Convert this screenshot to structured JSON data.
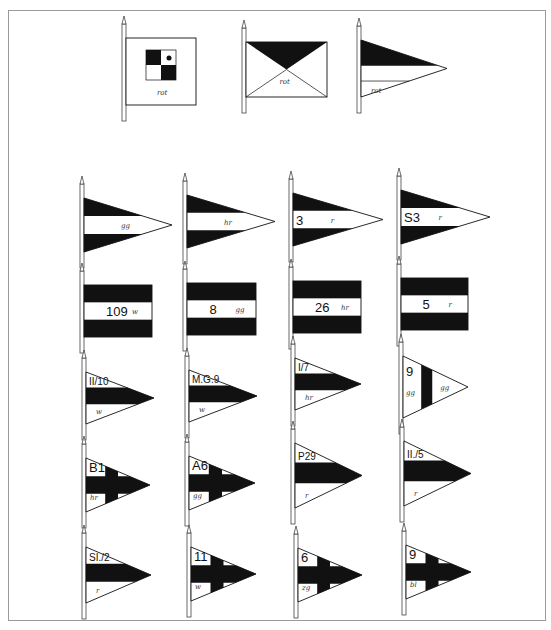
{
  "plate": {
    "frame": {
      "x": 8,
      "y": 10,
      "w": 538,
      "h": 611
    },
    "colors": {
      "ink": "#111111",
      "paper": "#ffffff",
      "frame": "#9a9a9a",
      "pole": "#555555"
    }
  },
  "top_row": [
    {
      "id": "checker-flag",
      "type": "checker",
      "pole_x": 125,
      "top": 38,
      "bottom": 105,
      "right": 196,
      "color_label": "rot",
      "corner_mark": "I.V."
    },
    {
      "id": "saltire-flag",
      "type": "saltire",
      "pole_x": 245,
      "top": 42,
      "bottom": 97,
      "right": 327,
      "color_label": "rot"
    },
    {
      "id": "split-pennant",
      "type": "split-pennant",
      "pole_x": 360,
      "top": 40,
      "bottom": 97,
      "tip_x": 447,
      "color_label": "rot"
    }
  ],
  "rows": [
    {
      "name": "triband-pennants",
      "items": [
        {
          "type": "tri-pennant",
          "pole_x": 83,
          "top": 198,
          "bottom": 252,
          "tip_x": 172,
          "number": "",
          "color_label": "gg"
        },
        {
          "type": "tri-pennant",
          "pole_x": 186,
          "top": 195,
          "bottom": 248,
          "tip_x": 275,
          "number": "",
          "color_label": "hr"
        },
        {
          "type": "tri-pennant",
          "pole_x": 292,
          "top": 193,
          "bottom": 246,
          "tip_x": 383,
          "number": "3",
          "color_label": "r"
        },
        {
          "type": "tri-pennant",
          "pole_x": 400,
          "top": 190,
          "bottom": 244,
          "tip_x": 490,
          "number": "S3",
          "color_label": "r"
        }
      ]
    },
    {
      "name": "triband-flags",
      "items": [
        {
          "type": "tri-flag",
          "pole_x": 83,
          "top": 285,
          "bottom": 337,
          "right": 152,
          "number": "109",
          "color_label": "w"
        },
        {
          "type": "tri-flag",
          "pole_x": 186,
          "top": 283,
          "bottom": 335,
          "right": 256,
          "number": "8",
          "color_label": "gg"
        },
        {
          "type": "tri-flag",
          "pole_x": 292,
          "top": 281,
          "bottom": 333,
          "right": 361,
          "number": "26",
          "color_label": "hr"
        },
        {
          "type": "tri-flag",
          "pole_x": 400,
          "top": 278,
          "bottom": 330,
          "right": 468,
          "number": "5",
          "color_label": "r"
        }
      ]
    },
    {
      "name": "band-pennants",
      "items": [
        {
          "type": "band-pennant",
          "pole_x": 85,
          "top": 372,
          "bottom": 424,
          "tip_x": 154,
          "number": "II/10",
          "color_label": "w"
        },
        {
          "type": "band-pennant",
          "pole_x": 188,
          "top": 370,
          "bottom": 422,
          "tip_x": 257,
          "number": "M.G.9",
          "color_label": "w"
        },
        {
          "type": "band-pennant",
          "pole_x": 294,
          "top": 358,
          "bottom": 410,
          "tip_x": 361,
          "number": "I/7",
          "color_label": "hr"
        },
        {
          "type": "vband-pennant",
          "pole_x": 402,
          "top": 356,
          "bottom": 418,
          "tip_x": 468,
          "number": "9",
          "color_label": "gg",
          "color_label_2": "gg"
        }
      ]
    },
    {
      "name": "cross-pennants-a",
      "items": [
        {
          "type": "cross-pennant",
          "pole_x": 85,
          "top": 458,
          "bottom": 512,
          "tip_x": 150,
          "number": "B1",
          "color_label": "hr"
        },
        {
          "type": "cross-pennant",
          "pole_x": 188,
          "top": 456,
          "bottom": 510,
          "tip_x": 255,
          "number": "A6",
          "color_label": "gg"
        },
        {
          "type": "band-pennant",
          "pole_x": 294,
          "top": 443,
          "bottom": 508,
          "tip_x": 362,
          "number": "P29",
          "color_label": "r"
        },
        {
          "type": "band-pennant",
          "pole_x": 403,
          "top": 441,
          "bottom": 506,
          "tip_x": 471,
          "number": "II./5",
          "color_label": "r"
        }
      ]
    },
    {
      "name": "mixed-pennants-b",
      "items": [
        {
          "type": "band-pennant",
          "pole_x": 85,
          "top": 547,
          "bottom": 603,
          "tip_x": 151,
          "number": "SI./2",
          "color_label": "r"
        },
        {
          "type": "cross-pennant",
          "pole_x": 190,
          "top": 547,
          "bottom": 601,
          "tip_x": 256,
          "number": "11",
          "color_label": "w"
        },
        {
          "type": "cross-pennant",
          "pole_x": 297,
          "top": 548,
          "bottom": 602,
          "tip_x": 362,
          "number": "6",
          "color_label": "zg"
        },
        {
          "type": "cross-pennant",
          "pole_x": 405,
          "top": 545,
          "bottom": 599,
          "tip_x": 471,
          "number": "9",
          "color_label": "bl"
        }
      ]
    }
  ]
}
